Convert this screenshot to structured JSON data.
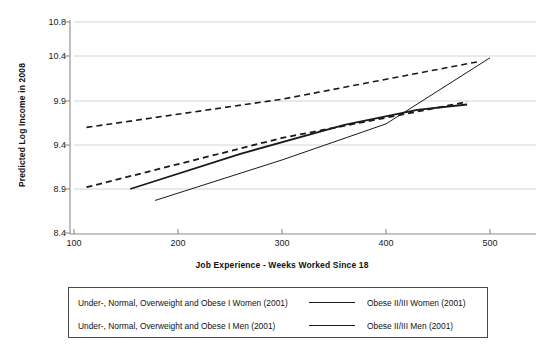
{
  "chart_data": {
    "type": "line",
    "title": "",
    "xlabel": "Job Experience - Weeks Worked Since 18",
    "ylabel": "Predicted Log Income in 2008",
    "xlim": [
      74,
      510
    ],
    "ylim": [
      8.4,
      10.8
    ],
    "xticks": [
      100,
      200,
      300,
      400,
      500
    ],
    "yticks": [
      8.4,
      8.9,
      9.4,
      9.9,
      10.4,
      10.8
    ],
    "grid": "horizontal",
    "legend_position": "below-axis",
    "axis_color": "#8a8a8a",
    "line_color": "#1a1a1a",
    "series": [
      {
        "name": "Under-, Normal, Overweight and Obese I Women (2001)",
        "style": "dashed",
        "width": 1.6,
        "points": [
          [
            112,
            9.6
          ],
          [
            300,
            9.92
          ],
          [
            490,
            10.34
          ]
        ]
      },
      {
        "name": "Under-, Normal, Overweight and Obese I Men (2001)",
        "style": "dashed",
        "width": 1.8,
        "points": [
          [
            112,
            8.92
          ],
          [
            300,
            9.48
          ],
          [
            478,
            9.89
          ]
        ]
      },
      {
        "name": "Obese II/III  Women (2001)",
        "style": "solid",
        "width": 1.8,
        "points": [
          [
            154,
            8.9
          ],
          [
            260,
            9.3
          ],
          [
            360,
            9.63
          ],
          [
            430,
            9.8
          ],
          [
            478,
            9.86
          ]
        ]
      },
      {
        "name": "Obese II/III Men (2001)",
        "style": "solid",
        "width": 1.0,
        "points": [
          [
            178,
            8.77
          ],
          [
            300,
            9.23
          ],
          [
            400,
            9.64
          ],
          [
            500,
            10.38
          ]
        ]
      }
    ]
  },
  "axis": {
    "y_title": "Predicted Log Income in 2008",
    "x_title": "Job Experience - Weeks Worked Since 18",
    "y_tick_labels": [
      "10.8",
      "10.4",
      "9.9",
      "9.4",
      "8.9",
      "8.4"
    ],
    "x_tick_labels": [
      "100",
      "200",
      "300",
      "400",
      "500"
    ]
  },
  "legend": {
    "rows": [
      {
        "left_label": "Under-, Normal, Overweight and Obese I Women (2001)",
        "right_label": "Obese II/III  Women (2001)",
        "sample": "solid-thick"
      },
      {
        "left_label": "Under-, Normal, Overweight and Obese I Men (2001)",
        "right_label": "Obese II/III Men (2001)",
        "sample": "solid-thin"
      }
    ]
  }
}
